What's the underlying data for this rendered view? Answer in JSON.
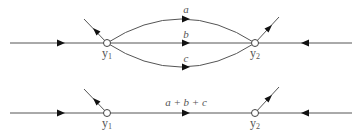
{
  "diagram": {
    "type": "signal-flow-graph",
    "top": {
      "nodes": [
        {
          "id": "y1",
          "label": "y",
          "subscript": "1"
        },
        {
          "id": "y2",
          "label": "y",
          "subscript": "2"
        }
      ],
      "branches": [
        {
          "from": "y1",
          "to": "y2",
          "label": "a",
          "shape": "upper-arc"
        },
        {
          "from": "y1",
          "to": "y2",
          "label": "b",
          "shape": "straight"
        },
        {
          "from": "y1",
          "to": "y2",
          "label": "c",
          "shape": "lower-arc"
        }
      ]
    },
    "bottom": {
      "nodes": [
        {
          "id": "y1",
          "label": "y",
          "subscript": "1"
        },
        {
          "id": "y2",
          "label": "y",
          "subscript": "2"
        }
      ],
      "branches": [
        {
          "from": "y1",
          "to": "y2",
          "label": "a + b + c",
          "shape": "straight"
        }
      ]
    },
    "colors": {
      "line": "#555555",
      "arrow": "#111111",
      "node_fill": "#ffffff"
    }
  }
}
